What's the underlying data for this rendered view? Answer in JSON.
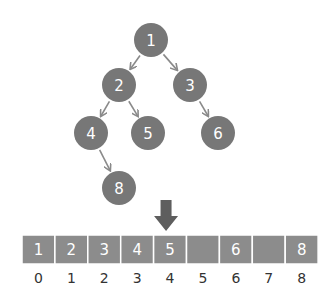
{
  "colors": {
    "node_fill": "#777777",
    "edge": "#8a8a8a",
    "cell_fill": "#8c8c8c",
    "cell_border": "#ffffff",
    "pointer": "#5e5e5e",
    "index_text": "#333333",
    "label_text": "#ffffff"
  },
  "tree": {
    "nodes": [
      {
        "id": "1",
        "label": "1",
        "cx": 151,
        "cy": 40
      },
      {
        "id": "2",
        "label": "2",
        "cx": 119,
        "cy": 85
      },
      {
        "id": "3",
        "label": "3",
        "cx": 190,
        "cy": 85
      },
      {
        "id": "4",
        "label": "4",
        "cx": 91,
        "cy": 133
      },
      {
        "id": "5",
        "label": "5",
        "cx": 148,
        "cy": 133
      },
      {
        "id": "6",
        "label": "6",
        "cx": 218,
        "cy": 133
      },
      {
        "id": "8",
        "label": "8",
        "cx": 119,
        "cy": 188
      }
    ],
    "edges": [
      {
        "from": "1",
        "to": "2"
      },
      {
        "from": "1",
        "to": "3"
      },
      {
        "from": "2",
        "to": "4"
      },
      {
        "from": "2",
        "to": "5"
      },
      {
        "from": "3",
        "to": "6"
      },
      {
        "from": "4",
        "to": "8"
      }
    ]
  },
  "array": {
    "x": 22,
    "y": 235,
    "cell_width": 32.9,
    "cell_height": 29,
    "cells": [
      {
        "index": "0",
        "value": "1"
      },
      {
        "index": "1",
        "value": "2"
      },
      {
        "index": "2",
        "value": "3"
      },
      {
        "index": "3",
        "value": "4"
      },
      {
        "index": "4",
        "value": "5"
      },
      {
        "index": "5",
        "value": ""
      },
      {
        "index": "6",
        "value": "6"
      },
      {
        "index": "7",
        "value": ""
      },
      {
        "index": "8",
        "value": "8"
      }
    ]
  },
  "pointer": {
    "points_to_index": "4",
    "description": "down-arrow"
  }
}
